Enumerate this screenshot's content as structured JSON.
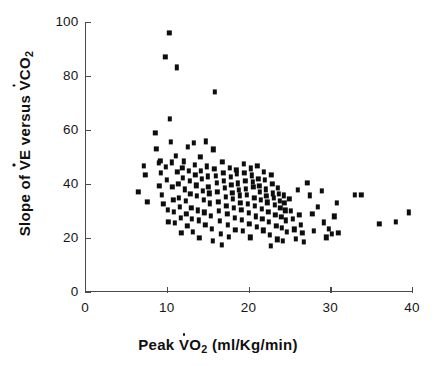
{
  "chart_data": {
    "type": "scatter",
    "title": "",
    "xlabel": "Peak V̇O₂ (ml/Kg/min)",
    "ylabel": "Slope of V̇E versus V̇CO₂",
    "xlim": [
      0,
      40
    ],
    "ylim": [
      0,
      100
    ],
    "xticks": [
      0,
      10,
      20,
      30,
      40
    ],
    "yticks": [
      0,
      20,
      40,
      60,
      80,
      100
    ],
    "grid": false,
    "legend": "none",
    "marker": "filled-square",
    "marker_color": "#0d0d0d",
    "n_points": 232,
    "points": [
      [
        6.5,
        37.2
      ],
      [
        7.2,
        46.8
      ],
      [
        7.4,
        43.3
      ],
      [
        7.6,
        33.3
      ],
      [
        8.6,
        58.8
      ],
      [
        8.7,
        52.9
      ],
      [
        9.0,
        47.8
      ],
      [
        9.1,
        39.2
      ],
      [
        9.2,
        48.5
      ],
      [
        9.3,
        44.1
      ],
      [
        9.4,
        36.0
      ],
      [
        9.6,
        32.5
      ],
      [
        9.8,
        87.0
      ],
      [
        9.9,
        46.2
      ],
      [
        10.0,
        41.5
      ],
      [
        10.1,
        30.5
      ],
      [
        10.2,
        26.0
      ],
      [
        10.3,
        95.9
      ],
      [
        10.4,
        64.0
      ],
      [
        10.5,
        55.5
      ],
      [
        10.6,
        48.0
      ],
      [
        10.7,
        38.8
      ],
      [
        10.8,
        34.2
      ],
      [
        10.9,
        29.8
      ],
      [
        11.0,
        25.5
      ],
      [
        11.1,
        50.5
      ],
      [
        11.2,
        83.2
      ],
      [
        11.3,
        44.5
      ],
      [
        11.4,
        40.0
      ],
      [
        11.5,
        35.0
      ],
      [
        11.6,
        31.5
      ],
      [
        11.7,
        27.3
      ],
      [
        11.8,
        22.0
      ],
      [
        11.9,
        46.0
      ],
      [
        12.0,
        42.2
      ],
      [
        12.1,
        48.4
      ],
      [
        12.2,
        38.0
      ],
      [
        12.3,
        33.8
      ],
      [
        12.4,
        29.0
      ],
      [
        12.5,
        24.5
      ],
      [
        12.6,
        53.8
      ],
      [
        12.7,
        45.0
      ],
      [
        12.8,
        41.0
      ],
      [
        12.9,
        36.2
      ],
      [
        13.0,
        31.0
      ],
      [
        13.1,
        27.0
      ],
      [
        13.2,
        22.2
      ],
      [
        13.3,
        55.2
      ],
      [
        13.4,
        47.0
      ],
      [
        13.5,
        43.5
      ],
      [
        13.6,
        39.5
      ],
      [
        13.7,
        35.5
      ],
      [
        13.8,
        30.2
      ],
      [
        13.9,
        26.5
      ],
      [
        14.0,
        20.0
      ],
      [
        14.1,
        50.0
      ],
      [
        14.2,
        44.8
      ],
      [
        14.3,
        41.8
      ],
      [
        14.4,
        37.5
      ],
      [
        14.5,
        34.0
      ],
      [
        14.6,
        29.5
      ],
      [
        14.7,
        25.0
      ],
      [
        14.8,
        55.8
      ],
      [
        14.9,
        46.5
      ],
      [
        15.0,
        42.8
      ],
      [
        15.1,
        39.0
      ],
      [
        15.2,
        36.5
      ],
      [
        15.3,
        32.8
      ],
      [
        15.4,
        28.2
      ],
      [
        15.5,
        23.5
      ],
      [
        15.6,
        19.0
      ],
      [
        15.7,
        52.8
      ],
      [
        15.8,
        45.5
      ],
      [
        15.9,
        74.2
      ],
      [
        16.0,
        43.0
      ],
      [
        16.1,
        40.5
      ],
      [
        16.2,
        37.0
      ],
      [
        16.3,
        33.5
      ],
      [
        16.4,
        30.0
      ],
      [
        16.5,
        26.2
      ],
      [
        16.6,
        21.5
      ],
      [
        16.7,
        17.5
      ],
      [
        16.8,
        48.2
      ],
      [
        16.9,
        44.2
      ],
      [
        17.0,
        41.0
      ],
      [
        17.1,
        38.5
      ],
      [
        17.2,
        35.2
      ],
      [
        17.3,
        32.0
      ],
      [
        17.4,
        28.8
      ],
      [
        17.5,
        24.8
      ],
      [
        17.6,
        20.5
      ],
      [
        17.7,
        46.0
      ],
      [
        17.8,
        42.5
      ],
      [
        17.9,
        39.8
      ],
      [
        18.0,
        36.8
      ],
      [
        18.1,
        34.5
      ],
      [
        18.2,
        31.2
      ],
      [
        18.3,
        27.5
      ],
      [
        18.4,
        23.0
      ],
      [
        18.5,
        45.2
      ],
      [
        18.6,
        43.8
      ],
      [
        18.7,
        40.2
      ],
      [
        18.8,
        37.8
      ],
      [
        18.9,
        35.8
      ],
      [
        19.0,
        33.0
      ],
      [
        19.1,
        30.5
      ],
      [
        19.2,
        26.8
      ],
      [
        19.3,
        22.5
      ],
      [
        19.4,
        47.5
      ],
      [
        19.5,
        44.0
      ],
      [
        19.6,
        41.2
      ],
      [
        19.7,
        38.2
      ],
      [
        19.8,
        36.0
      ],
      [
        19.9,
        32.5
      ],
      [
        20.0,
        29.2
      ],
      [
        20.1,
        25.2
      ],
      [
        20.2,
        20.2
      ],
      [
        20.3,
        45.8
      ],
      [
        20.4,
        43.2
      ],
      [
        20.5,
        40.8
      ],
      [
        20.6,
        38.8
      ],
      [
        20.7,
        35.0
      ],
      [
        20.8,
        31.8
      ],
      [
        20.9,
        28.0
      ],
      [
        21.0,
        24.0
      ],
      [
        21.1,
        46.8
      ],
      [
        21.2,
        42.0
      ],
      [
        21.3,
        39.2
      ],
      [
        21.4,
        37.2
      ],
      [
        21.5,
        34.2
      ],
      [
        21.6,
        30.8
      ],
      [
        21.7,
        27.2
      ],
      [
        21.8,
        22.8
      ],
      [
        21.9,
        44.5
      ],
      [
        22.0,
        41.5
      ],
      [
        22.1,
        38.0
      ],
      [
        22.2,
        35.5
      ],
      [
        22.3,
        33.2
      ],
      [
        22.4,
        29.8
      ],
      [
        22.5,
        26.0
      ],
      [
        22.6,
        21.0
      ],
      [
        22.7,
        17.0
      ],
      [
        22.8,
        43.5
      ],
      [
        22.9,
        40.0
      ],
      [
        23.0,
        36.5
      ],
      [
        23.1,
        34.8
      ],
      [
        23.2,
        32.2
      ],
      [
        23.3,
        28.5
      ],
      [
        23.4,
        24.5
      ],
      [
        23.5,
        19.5
      ],
      [
        23.6,
        38.5
      ],
      [
        23.7,
        36.2
      ],
      [
        23.8,
        33.8
      ],
      [
        23.9,
        31.0
      ],
      [
        24.0,
        27.8
      ],
      [
        24.1,
        23.8
      ],
      [
        24.2,
        18.8
      ],
      [
        24.3,
        35.8
      ],
      [
        24.4,
        33.0
      ],
      [
        24.5,
        30.2
      ],
      [
        24.6,
        26.5
      ],
      [
        24.7,
        22.2
      ],
      [
        25.0,
        34.5
      ],
      [
        25.2,
        30.0
      ],
      [
        25.4,
        27.0
      ],
      [
        25.6,
        23.2
      ],
      [
        25.8,
        19.8
      ],
      [
        26.0,
        37.8
      ],
      [
        26.2,
        28.5
      ],
      [
        26.4,
        25.0
      ],
      [
        26.6,
        21.8
      ],
      [
        26.8,
        18.5
      ],
      [
        27.2,
        40.5
      ],
      [
        27.5,
        35.8
      ],
      [
        27.8,
        29.0
      ],
      [
        28.0,
        22.5
      ],
      [
        28.5,
        31.5
      ],
      [
        29.0,
        37.5
      ],
      [
        29.2,
        25.8
      ],
      [
        29.5,
        20.2
      ],
      [
        29.8,
        23.5
      ],
      [
        30.2,
        21.5
      ],
      [
        30.5,
        28.0
      ],
      [
        30.8,
        33.0
      ],
      [
        31.0,
        21.8
      ],
      [
        33.0,
        36.0
      ],
      [
        33.8,
        36.0
      ],
      [
        36.0,
        25.2
      ],
      [
        38.0,
        26.0
      ],
      [
        39.6,
        29.5
      ]
    ]
  },
  "axis": {
    "x_title_parts": {
      "prefix": "Peak ",
      "v": "V",
      "symbol_sub": "O",
      "sub": "2",
      "suffix": " (ml/Kg/min)"
    },
    "y_title_parts": {
      "prefix": "Slope of ",
      "v1": "V",
      "v1_sub": "E",
      "middle": " versus ",
      "v2": "V",
      "v2_sub": "CO",
      "sub2": "2"
    }
  }
}
